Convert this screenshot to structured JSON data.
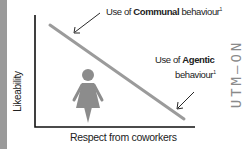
{
  "diagram": {
    "y_axis_label": "Likeability",
    "x_axis_label": "Respect from coworkers",
    "communal": {
      "prefix": "Use of ",
      "bold": "Communal",
      "suffix": " behaviour",
      "sup": "1"
    },
    "agentic": {
      "prefix": "Use of ",
      "bold": "Agentic",
      "line2": "behaviour",
      "sup": "1"
    },
    "icon": "woman-icon",
    "side_text": "UTM—ON",
    "colors": {
      "line": "#9b9b9b",
      "axis": "#111111",
      "icon": "#8c8c8c",
      "strip": "#9a9a9a"
    }
  }
}
